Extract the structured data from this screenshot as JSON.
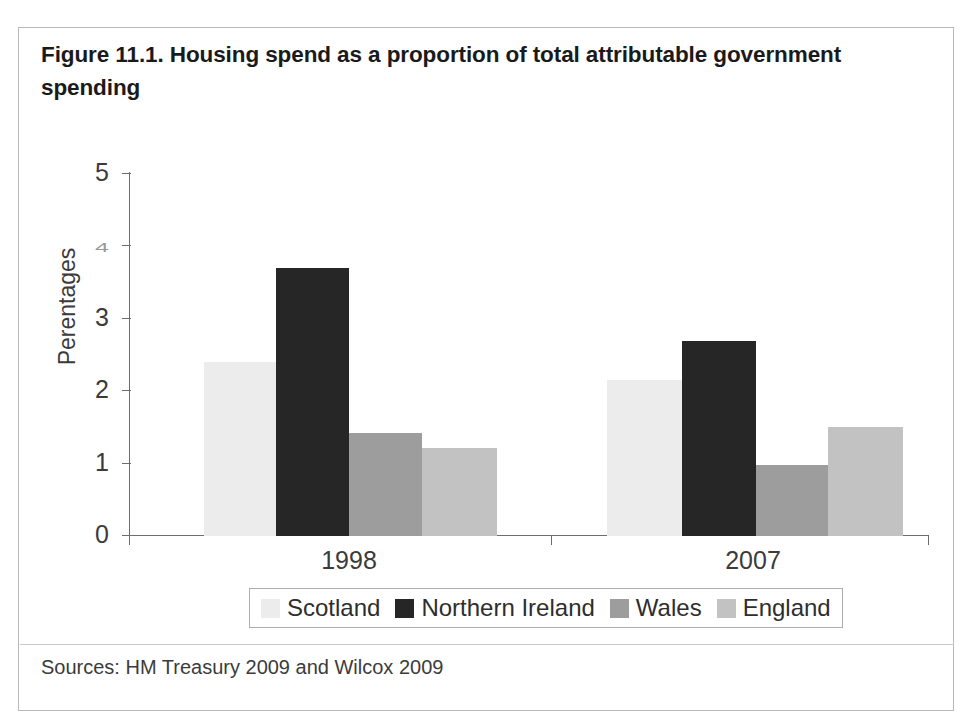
{
  "figure": {
    "title": "Figure 11.1. Housing spend as a proportion of total attributable government spending",
    "source_note": "Sources: HM Treasury 2009 and Wilcox 2009"
  },
  "chart_data": {
    "type": "bar",
    "title": "Figure 11.1. Housing spend as a proportion of total attributable government spending",
    "xlabel": "",
    "ylabel": "Perentages",
    "categories": [
      "1998",
      "2007"
    ],
    "series": [
      {
        "name": "Scotland",
        "values": [
          2.4,
          2.15
        ],
        "color": "#ececec"
      },
      {
        "name": "Northern Ireland",
        "values": [
          3.7,
          2.7
        ],
        "color": "#262626"
      },
      {
        "name": "Wales",
        "values": [
          1.4,
          1.0
        ],
        "color": "#9d9d9d"
      },
      {
        "name": "England",
        "values": [
          1.2,
          1.5
        ],
        "color": "#c2c2c2"
      }
    ],
    "ylim": [
      0,
      5
    ],
    "yticks": [
      "0",
      "1",
      "2",
      "3",
      "4",
      "5"
    ],
    "grid": false,
    "legend_position": "bottom"
  },
  "axis": {
    "y_title": "Perentages",
    "y_ticks": [
      {
        "label": "5",
        "value": 5,
        "degraded": false
      },
      {
        "label": "4",
        "value": 4,
        "degraded": true
      },
      {
        "label": "3",
        "value": 3,
        "degraded": false
      },
      {
        "label": "2",
        "value": 2,
        "degraded": false
      },
      {
        "label": "1",
        "value": 1,
        "degraded": false
      },
      {
        "label": "0",
        "value": 0,
        "degraded": false
      }
    ],
    "x_labels": [
      "1998",
      "2007"
    ]
  },
  "legend": {
    "items": [
      {
        "label": "Scotland",
        "color": "#ececec"
      },
      {
        "label": "Northern Ireland",
        "color": "#262626"
      },
      {
        "label": "Wales",
        "color": "#9d9d9d"
      },
      {
        "label": "England",
        "color": "#c2c2c2"
      }
    ]
  },
  "bars": [
    {
      "name": "bar-scotland-1998",
      "group": "1998",
      "series": "Scotland",
      "value": 2.4,
      "x": 185,
      "width": 72,
      "color": "#ececec"
    },
    {
      "name": "bar-northern-ireland-1998",
      "group": "1998",
      "series": "Northern Ireland",
      "value": 3.7,
      "x": 257,
      "width": 73,
      "color": "#262626"
    },
    {
      "name": "bar-wales-1998",
      "group": "1998",
      "series": "Wales",
      "value": 1.42,
      "x": 330,
      "width": 73,
      "color": "#9d9d9d"
    },
    {
      "name": "bar-england-1998",
      "group": "1998",
      "series": "England",
      "value": 1.21,
      "x": 403,
      "width": 75,
      "color": "#c2c2c2"
    },
    {
      "name": "bar-scotland-2007",
      "group": "2007",
      "series": "Scotland",
      "value": 2.15,
      "x": 588,
      "width": 75,
      "color": "#ececec"
    },
    {
      "name": "bar-northern-ireland-2007",
      "group": "2007",
      "series": "Northern Ireland",
      "value": 2.7,
      "x": 663,
      "width": 74,
      "color": "#262626"
    },
    {
      "name": "bar-wales-2007",
      "group": "2007",
      "series": "Wales",
      "value": 0.98,
      "x": 737,
      "width": 72,
      "color": "#9d9d9d"
    },
    {
      "name": "bar-england-2007",
      "group": "2007",
      "series": "England",
      "value": 1.5,
      "x": 809,
      "width": 75,
      "color": "#c2c2c2"
    }
  ],
  "geometry": {
    "baseline_y": 407,
    "px_per_unit": 72.4
  }
}
